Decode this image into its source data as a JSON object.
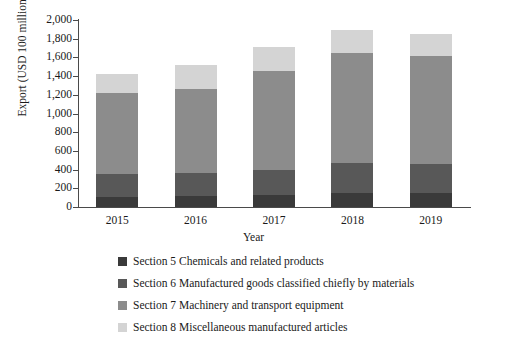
{
  "chart_data": {
    "type": "bar",
    "subtype": "stacked-bar",
    "title": "",
    "xlabel": "Year",
    "ylabel": "Export (USD 100 million)",
    "categories": [
      "2015",
      "2016",
      "2017",
      "2018",
      "2019"
    ],
    "ylim": [
      0,
      2000
    ],
    "yticks": [
      0,
      200,
      400,
      600,
      800,
      1000,
      1200,
      1400,
      1600,
      1800,
      2000
    ],
    "ytick_labels": [
      "0",
      "200",
      "400",
      "600",
      "800",
      "1,000",
      "1,200",
      "1,400",
      "1,600",
      "1,800",
      "2,000"
    ],
    "grid": false,
    "legend_position": "bottom",
    "series": [
      {
        "name": "Section 5 Chemicals and related products",
        "color": "#3a3a3a",
        "values": [
          110,
          115,
          125,
          150,
          155
        ]
      },
      {
        "name": "Section 6 Manufactured goods classified chiefly by materials",
        "color": "#585858",
        "values": [
          245,
          250,
          275,
          320,
          300
        ]
      },
      {
        "name": "Section 7 Machinery and transport equipment",
        "color": "#8c8c8c",
        "values": [
          865,
          900,
          1055,
          1180,
          1155
        ]
      },
      {
        "name": "Section 8 Miscellaneous manufactured articles",
        "color": "#d4d4d4",
        "values": [
          200,
          255,
          255,
          240,
          245
        ]
      }
    ],
    "totals": [
      1420,
      1520,
      1710,
      1890,
      1855
    ]
  },
  "axis": {
    "y_title": "Export (USD 100 million)",
    "x_title": "Year"
  },
  "legend": {
    "items": [
      {
        "label": "Section 5 Chemicals and related products",
        "color": "#3a3a3a"
      },
      {
        "label": "Section 6 Manufactured goods classified chiefly by materials",
        "color": "#585858"
      },
      {
        "label": "Section 7 Machinery and transport equipment",
        "color": "#8c8c8c"
      },
      {
        "label": "Section 8 Miscellaneous manufactured articles",
        "color": "#d4d4d4"
      }
    ]
  }
}
